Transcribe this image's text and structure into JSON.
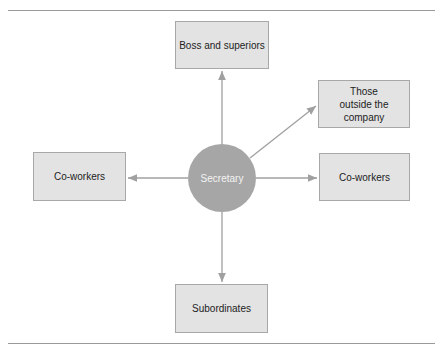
{
  "diagram": {
    "center": {
      "label": "Secretary"
    },
    "nodes": {
      "top": {
        "label": "Boss and superiors"
      },
      "upper_right": {
        "label": "Those outside the company"
      },
      "left": {
        "label": "Co-workers"
      },
      "right": {
        "label": "Co-workers"
      },
      "bottom": {
        "label": "Subordinates"
      }
    },
    "colors": {
      "box_fill": "#e3e3e3",
      "circle_fill": "#a6a6a6",
      "arrow": "#a0a0a0"
    }
  }
}
